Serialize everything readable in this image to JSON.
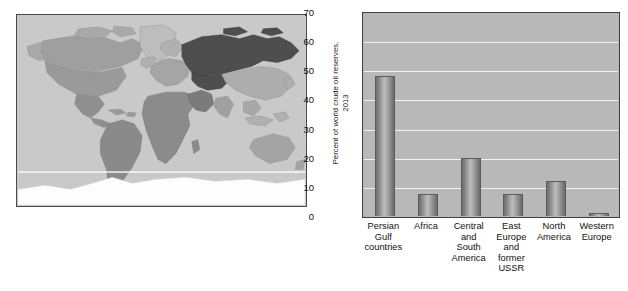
{
  "figure": {
    "map": {
      "name": "world-oil-reserves-map",
      "alt_text": "World map with regions shaded by crude oil reserves",
      "colors": {
        "ocean": "#c9c9c9",
        "land_light": "#c2c2c2",
        "land_mid": "#9a9a9a",
        "land_dark": "#4e4e4e",
        "antarctica": "#fdfdfd",
        "border": "#4a4a4a"
      }
    }
  },
  "chart_data": {
    "type": "bar",
    "title": "",
    "xlabel": "",
    "ylabel": "Percent of world crude oil reserves, 2013",
    "ylabel_line1": "Percent of world crude oil reserves,",
    "ylabel_line2": "2013",
    "ylim": [
      0,
      70
    ],
    "ytick_values": [
      0,
      10,
      20,
      30,
      40,
      50,
      60,
      70
    ],
    "ytick_labels": [
      "0",
      "10",
      "20",
      "30",
      "40",
      "50",
      "60",
      "70"
    ],
    "grid": true,
    "grid_color": "#f2f2f2",
    "legend": null,
    "plot_background": "#b8b8b8",
    "bar_color": "#a0a0a0",
    "categories": [
      "Persian Gulf countries",
      "Africa",
      "Central and South America",
      "East Europe and former USSR",
      "North America",
      "Western Europe"
    ],
    "category_label_lines": [
      [
        "Persian",
        "Gulf",
        "countries"
      ],
      [
        "Africa"
      ],
      [
        "Central",
        "and",
        "South",
        "America"
      ],
      [
        "East",
        "Europe",
        "and",
        "former",
        "USSR"
      ],
      [
        "North",
        "America"
      ],
      [
        "Western",
        "Europe"
      ]
    ],
    "values": [
      48,
      7.5,
      20,
      7.5,
      12,
      1
    ]
  }
}
